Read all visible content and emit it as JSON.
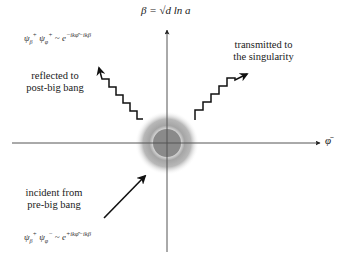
{
  "axes": {
    "y_label": "β = √d ln a",
    "x_label": "φ̄"
  },
  "labels": {
    "reflected": [
      "reflected to",
      "post-big bang"
    ],
    "transmitted": [
      "transmitted to",
      "the singularity"
    ],
    "incident": [
      "incident from",
      "pre-big bang"
    ]
  },
  "formulas": {
    "reflected": "ψβ+ ψφ+ ~ e^(−ikφ̄ − ikβ)",
    "incident": "ψβ+ ψφ− ~ e^(+ikφ̄ − ikβ)"
  },
  "colors": {
    "axis": "#555555",
    "arrow": "#111111",
    "core": "#8a8a8a",
    "halo": "#9a9a9a"
  }
}
